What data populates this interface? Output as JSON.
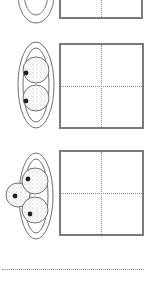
{
  "worksheet": {
    "rows": [
      {
        "index": 0,
        "balls": 0,
        "plate": "plate-top-partial",
        "grid": "answer-grid-1"
      },
      {
        "index": 1,
        "balls": 2,
        "plate": "plate-two-balls",
        "grid": "answer-grid-2"
      },
      {
        "index": 2,
        "balls": 3,
        "plate": "plate-three-balls",
        "grid": "answer-grid-3"
      }
    ],
    "colors": {
      "line": "#6f6f6f",
      "grid_border": "#7a7a7a",
      "dotted": "#8a8a8a",
      "ball_fill": "#f4f4f4",
      "ball_dot": "#222222"
    }
  }
}
